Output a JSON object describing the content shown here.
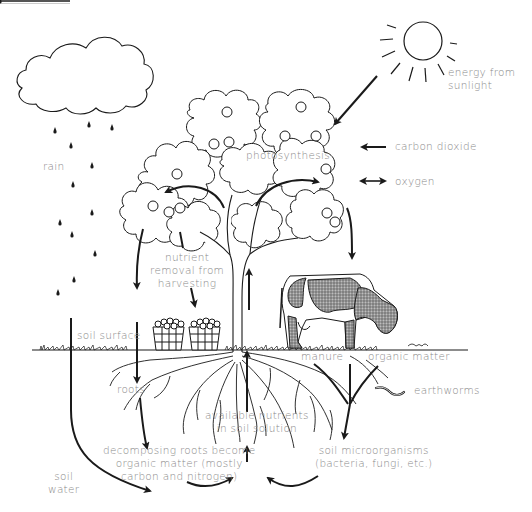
{
  "diagram": {
    "title_fragment": "...",
    "labels": {
      "energy_from_sunlight": "energy from\nsunlight",
      "carbon_dioxide": "carbon dioxide",
      "oxygen": "oxygen",
      "photosynthesis": "photosynthesis",
      "rain": "rain",
      "nutrient_removal": "nutrient\nremoval from\nharvesting",
      "soil_surface": "soil surface",
      "roots": "roots",
      "manure": "manure",
      "organic_matter": "organic matter",
      "earthworms": "earthworms",
      "available_nutrients": "available nutrients\nin soil solution",
      "decomposing_roots": "decomposing roots become\norganic matter (mostly\ncarbon and nitrogen)",
      "soil_microorganisms": "soil microorganisms\n(bacteria, fungi, etc.)",
      "soil_water": "soil\nwater"
    },
    "elements": [
      "sun",
      "cloud",
      "raindrops",
      "apple-tree",
      "cow",
      "apple-baskets",
      "grass-soil-surface",
      "roots",
      "earthworm",
      "flow-arrows"
    ],
    "colors": {
      "line": "#1a1a1a",
      "label": "#8a8a8a",
      "background": "#ffffff"
    }
  }
}
